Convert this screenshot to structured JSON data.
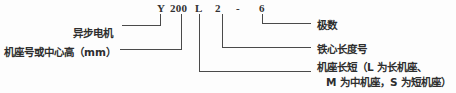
{
  "diagram": {
    "code_line": {
      "parts": [
        {
          "key": "brand",
          "text": "Y"
        },
        {
          "key": "height",
          "text": "200"
        },
        {
          "key": "length",
          "text": "L"
        },
        {
          "key": "core",
          "text": "2"
        },
        {
          "key": "dash",
          "text": "-"
        },
        {
          "key": "poles",
          "text": "6"
        }
      ]
    },
    "callouts": {
      "async_motor": "异步电机",
      "frame_or_center_height": "机座号或中心高（mm）",
      "pole_number": "极数",
      "core_length_code": "铁心长度号",
      "frame_length_line1": "机座长短（L 为长机座、",
      "frame_length_line2": "M 为中机座，S 为短机座）"
    },
    "style": {
      "line_color": "#4a4a4a",
      "text_color": "#2e2e2e",
      "background": "#fdfdfd"
    }
  }
}
